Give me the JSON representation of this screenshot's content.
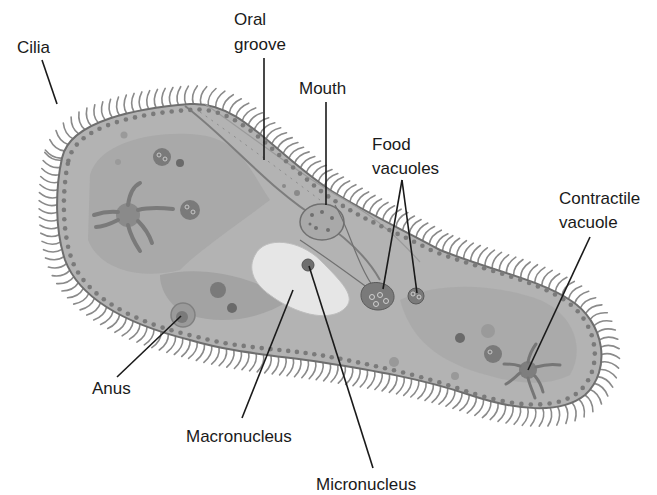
{
  "diagram": {
    "labels": {
      "cilia": "Cilia",
      "oral_groove_1": "Oral",
      "oral_groove_2": "groove",
      "mouth": "Mouth",
      "food_vacuoles_1": "Food",
      "food_vacuoles_2": "vacuoles",
      "contractile_vacuole_1": "Contractile",
      "contractile_vacuole_2": "vacuole",
      "anus": "Anus",
      "macronucleus": "Macronucleus",
      "micronucleus": "Micronucleus"
    },
    "colors": {
      "cell_body": "#b3b3b3",
      "cell_outline": "#6e6e6e",
      "inner_region": "#a2a2a2",
      "macronucleus": "#e6e6e6",
      "organelle_dark": "#6f6f6f",
      "dots": "#7a7a7a",
      "cilia": "#8a8a8a",
      "label_text": "#1a1a1a"
    }
  }
}
